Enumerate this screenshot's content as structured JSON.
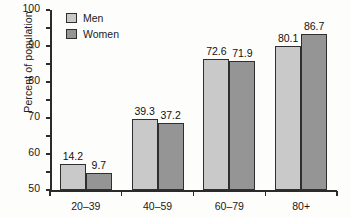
{
  "chart_data": {
    "type": "bar",
    "title": "",
    "xlabel": "",
    "ylabel": "Percent of population",
    "categories": [
      "20–39",
      "40–59",
      "60–79",
      "80+"
    ],
    "series": [
      {
        "name": "Men",
        "values": [
          14.2,
          39.3,
          72.6,
          80.1
        ],
        "color": "#c9c9c9"
      },
      {
        "name": "Women",
        "values": [
          9.7,
          37.2,
          71.9,
          86.7
        ],
        "color": "#959595"
      }
    ],
    "ylim": [
      0,
      100
    ],
    "yticks": [
      0,
      10,
      20,
      30,
      40,
      50,
      60,
      70,
      80,
      90,
      100
    ],
    "yticklabels": [
      "0",
      "10",
      "20",
      "30",
      "40",
      "50",
      "60",
      "70",
      "80",
      "90",
      "100"
    ],
    "datalabels": [
      [
        "14.2",
        "9.7"
      ],
      [
        "39.3",
        "37.2"
      ],
      [
        "72.6",
        "71.9"
      ],
      [
        "80.1",
        "86.7"
      ]
    ],
    "grid": false,
    "legend": {
      "position": "top-left",
      "entries": [
        {
          "label": "Men",
          "swatch": "men"
        },
        {
          "label": "Women",
          "swatch": "women"
        }
      ]
    },
    "axis_color": "#2b2b2b",
    "bar_border_color": "#2f2f2f",
    "background": "#fdfdfc"
  }
}
